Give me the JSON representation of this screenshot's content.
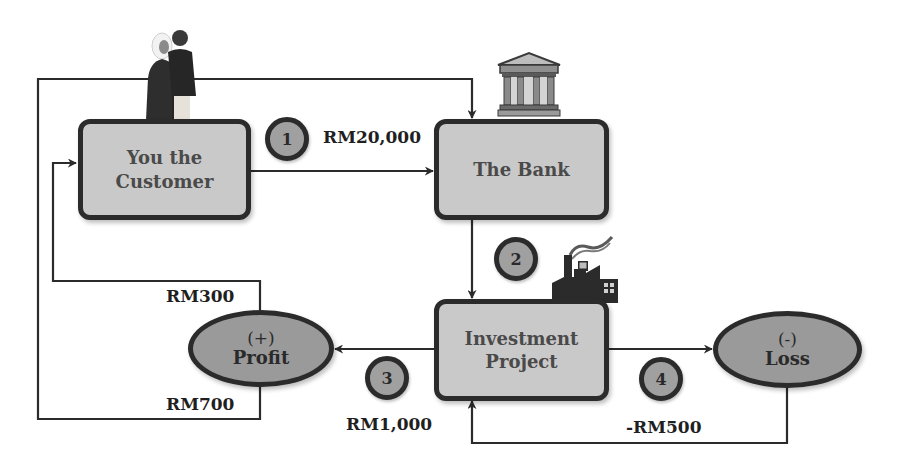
{
  "nodes": {
    "customer": {
      "label_line1": "You the",
      "label_line2": "Customer"
    },
    "bank": {
      "label": "The Bank"
    },
    "investment": {
      "label_line1": "Investment",
      "label_line2": "Project"
    },
    "profit": {
      "sign": "(+)",
      "label": "Profit"
    },
    "loss": {
      "sign": "(-)",
      "label": "Loss"
    }
  },
  "steps": [
    {
      "number": "1",
      "amount": "RM20,000"
    },
    {
      "number": "2",
      "amount": ""
    },
    {
      "number": "3",
      "amount": "RM1,000"
    },
    {
      "number": "4",
      "amount": "-RM500"
    }
  ],
  "profit_split": {
    "customer_share": "RM300",
    "bank_share": "RM700"
  },
  "icons": {
    "customer": "people-couple-icon",
    "bank": "bank-building-icon",
    "investment": "factory-icon"
  },
  "colors": {
    "box_fill": "#c9c9c9",
    "ellipse_fill": "#9a9a9a",
    "badge_fill": "#a0a0a0",
    "stroke": "#2b2b2b",
    "box_text": "#4a4a4a"
  }
}
